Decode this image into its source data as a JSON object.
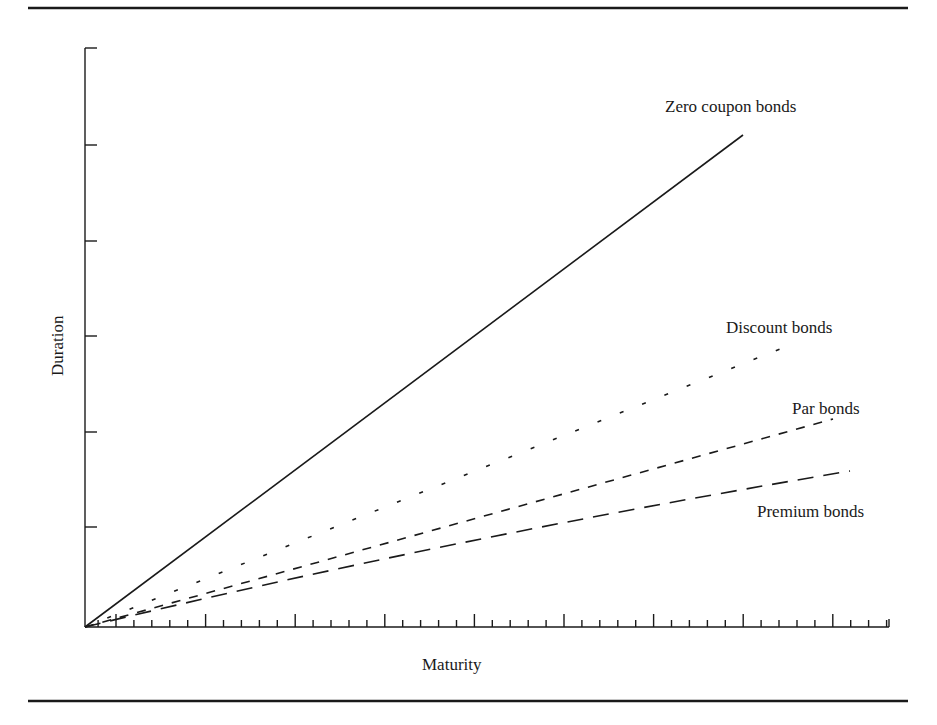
{
  "chart_data": {
    "type": "line",
    "title": "",
    "xlabel": "Maturity",
    "ylabel": "Duration",
    "grid": false,
    "legend": "inline labels at line ends",
    "x_ticks": {
      "major_count": 9,
      "minor_per_major": 5,
      "labels": []
    },
    "y_ticks": {
      "count": 6,
      "labels": []
    },
    "series": [
      {
        "name": "Zero coupon bonds",
        "style": "solid",
        "points": [
          [
            0,
            0
          ],
          [
            1,
            1
          ]
        ]
      },
      {
        "name": "Discount bonds",
        "style": "dotted",
        "points": [
          [
            0,
            0
          ],
          [
            1.07,
            0.57
          ]
        ]
      },
      {
        "name": "Par bonds",
        "style": "short-dashed",
        "points": [
          [
            0,
            0
          ],
          [
            1.14,
            0.42
          ]
        ]
      },
      {
        "name": "Premium bonds",
        "style": "long-dashed",
        "points": [
          [
            0,
            0
          ],
          [
            0.5,
            0.16
          ],
          [
            1.16,
            0.32
          ]
        ]
      }
    ]
  },
  "labels": {
    "zero": "Zero coupon bonds",
    "discount": "Discount bonds",
    "par": "Par bonds",
    "premium": "Premium bonds",
    "xaxis": "Maturity",
    "yaxis": "Duration"
  },
  "colors": {
    "ink": "#1a1a1a",
    "background": "#ffffff"
  }
}
